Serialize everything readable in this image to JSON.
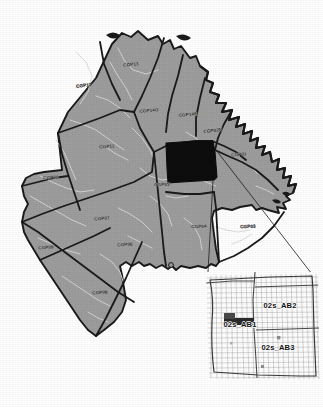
{
  "figure": {
    "background_color": "#ffffff",
    "district_fill": "#9d9d9d",
    "highlight_fill": "#0d0d0d",
    "district_border_color": "#1a1a1a",
    "street_color": "#d8d8d8",
    "inset_grid_color": "#8a8a8a",
    "leader_line_color": "#1a1a1a"
  },
  "main_map": {
    "name": "cgp-districts",
    "districts": [
      {
        "id": "CGP13",
        "label": "CGP13",
        "label_x": 131,
        "label_y": 66,
        "rotate": -6
      },
      {
        "id": "CGP12",
        "label": "CGP12",
        "label_x": 84,
        "label_y": 87,
        "rotate": -8
      },
      {
        "id": "CGP14O",
        "label": "CGP14O",
        "label_x": 149,
        "label_y": 112,
        "rotate": -4
      },
      {
        "id": "CGP14E",
        "label": "CGP14E",
        "label_x": 188,
        "label_y": 116,
        "rotate": -4
      },
      {
        "id": "CGP02N",
        "label": "CGP02N",
        "label_x": 213,
        "label_y": 132,
        "rotate": -6
      },
      {
        "id": "CGP01",
        "label": "CGP01",
        "label_x": 239,
        "label_y": 156,
        "rotate": -3
      },
      {
        "id": "CGP11",
        "label": "CGP11",
        "label_x": 107,
        "label_y": 148,
        "rotate": -4
      },
      {
        "id": "CGP10",
        "label": "CGP10",
        "label_x": 51,
        "label_y": 179,
        "rotate": -3
      },
      {
        "id": "CGP05",
        "label": "CGP05",
        "label_x": 162,
        "label_y": 186,
        "rotate": -2
      },
      {
        "id": "CGP07",
        "label": "CGP07",
        "label_x": 102,
        "label_y": 220,
        "rotate": -3
      },
      {
        "id": "CGP04",
        "label": "CGP04",
        "label_x": 199,
        "label_y": 228,
        "rotate": -2
      },
      {
        "id": "CGP03",
        "label": "CGP03",
        "label_x": 248,
        "label_y": 228,
        "rotate": -2
      },
      {
        "id": "CGP09",
        "label": "CGP09",
        "label_x": 46,
        "label_y": 249,
        "rotate": -3
      },
      {
        "id": "CGP06",
        "label": "CGP06",
        "label_x": 125,
        "label_y": 246,
        "rotate": -3
      },
      {
        "id": "CGP08",
        "label": "CGP08",
        "label_x": 100,
        "label_y": 294,
        "rotate": -3
      }
    ],
    "highlighted_district": "CGP02S"
  },
  "inset": {
    "name": "zoom-inset",
    "areas": [
      {
        "id": "02s_AB1",
        "label": "02s_AB1",
        "label_x": 240,
        "label_y": 327
      },
      {
        "id": "02s_AB2",
        "label": "02s_AB2",
        "label_x": 280,
        "label_y": 308
      },
      {
        "id": "02s_AB3",
        "label": "02s_AB3",
        "label_x": 278,
        "label_y": 350
      }
    ],
    "highlight_patch": {
      "x": 224,
      "y": 318,
      "width": 30,
      "height": 7
    }
  }
}
